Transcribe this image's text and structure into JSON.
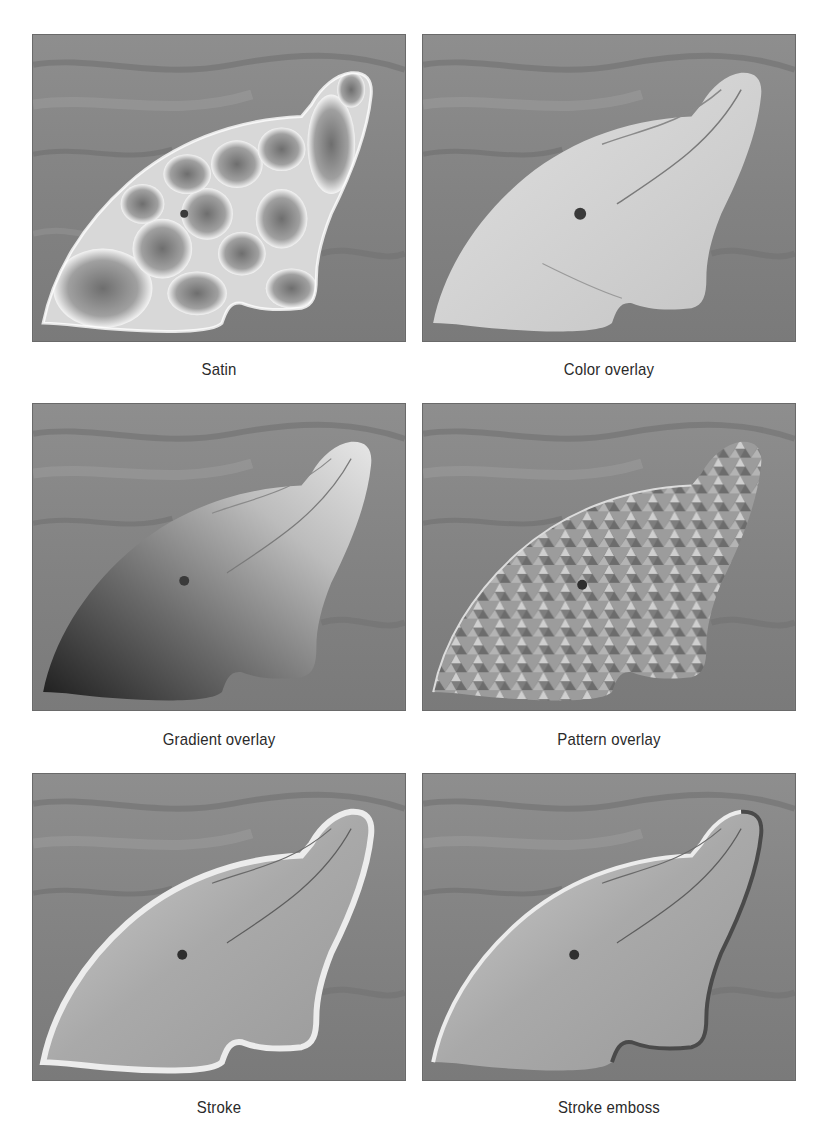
{
  "figure": {
    "panels": [
      {
        "id": "satin",
        "caption": "Satin",
        "effect": "satin"
      },
      {
        "id": "color-overlay",
        "caption": "Color overlay",
        "effect": "color-overlay"
      },
      {
        "id": "gradient-overlay",
        "caption": "Gradient overlay",
        "effect": "gradient-overlay"
      },
      {
        "id": "pattern-overlay",
        "caption": "Pattern overlay",
        "effect": "pattern-overlay"
      },
      {
        "id": "stroke",
        "caption": "Stroke",
        "effect": "stroke"
      },
      {
        "id": "stroke-emboss",
        "caption": "Stroke emboss",
        "effect": "stroke-emboss"
      }
    ],
    "colors": {
      "background": "#ffffff",
      "water": "#8a8a8a",
      "dolphin_body": "#b0b0b0",
      "highlight": "#f2f2f2",
      "dark": "#2a2a2a",
      "caption_text": "#2a2a2a"
    }
  }
}
